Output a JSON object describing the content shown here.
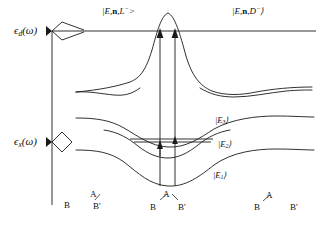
{
  "figure": {
    "type": "energy-level-potential-curve-diagram",
    "width": 321,
    "height": 226,
    "background": "#ffffff",
    "stroke_color": "#1a1a1a",
    "text_color": "#101010"
  },
  "axes": {
    "vertical_axis_x": 52,
    "ticks": [
      {
        "name": "epsilon-d-omega",
        "label_parts": {
          "symbol": "ϵ",
          "subscript": "d",
          "arg": "(ω)"
        },
        "label_text": "ϵd(ω)",
        "y": 31
      },
      {
        "name": "epsilon-x-omega",
        "label_parts": {
          "symbol": "ϵ",
          "subscript": "x",
          "arg": "(ω)"
        },
        "label_text": "ϵx(ω)",
        "y": 142
      }
    ]
  },
  "upper_states": {
    "left_label": {
      "text": "|E,n,L⁻>",
      "parts": {
        "bra": "|",
        "E": "E",
        "n": "n",
        "ion": "L",
        "charge": "−",
        "close": ">"
      },
      "x": 102,
      "y": 11
    },
    "right_label": {
      "text": "|E,n,D⁻⟩",
      "parts": {
        "bra": "|",
        "E": "E",
        "n": "n",
        "ion": "D",
        "charge": "−",
        "close": "⟩"
      },
      "x": 232,
      "y": 11
    },
    "continuum_line_y": 31
  },
  "bound_states": [
    {
      "name": "state-E3",
      "label": "|E₃⟩",
      "base": "E",
      "index": "3",
      "x": 215,
      "y": 121
    },
    {
      "name": "state-E2",
      "label": "|E₂⟩",
      "base": "E",
      "index": "2",
      "x": 218,
      "y": 145
    },
    {
      "name": "state-E1",
      "label": "|E₁⟩",
      "base": "E",
      "index": "1",
      "x": 213,
      "y": 176
    }
  ],
  "transitions": [
    {
      "name": "pump-arrow-left",
      "x": 160,
      "from_y": 186,
      "to_y": 31
    },
    {
      "name": "pump-arrow-right",
      "x": 175,
      "from_y": 186,
      "to_y": 31
    },
    {
      "name": "intermediate-arrow",
      "x": 160,
      "from_y": 155,
      "to_y": 139
    }
  ],
  "vibrational_level_line": {
    "name": "E2-vibrational-level",
    "x1": 130,
    "x2": 213,
    "y": 139
  },
  "reaction_coordinates": [
    {
      "name": "coord-left-B",
      "label": "B",
      "x": 66,
      "y": 206
    },
    {
      "name": "coord-left-A",
      "label": "A",
      "x": 92,
      "y": 196
    },
    {
      "name": "coord-left-Bprime",
      "label": "B'",
      "x": 95,
      "y": 208
    },
    {
      "name": "coord-mid-A",
      "label": "A",
      "x": 165,
      "y": 196
    },
    {
      "name": "coord-mid-B",
      "label": "B",
      "x": 152,
      "y": 209
    },
    {
      "name": "coord-mid-Bprime",
      "label": "B'",
      "x": 180,
      "y": 209
    },
    {
      "name": "coord-right-A",
      "label": "A",
      "x": 268,
      "y": 197
    },
    {
      "name": "coord-right-B",
      "label": "B",
      "x": 256,
      "y": 209
    },
    {
      "name": "coord-right-Bprime",
      "label": "B'",
      "x": 292,
      "y": 209
    }
  ],
  "curves": {
    "continuum_horizontal": "horizontal line at y=31 from x=52 to x=316",
    "peak_curve": "sharp resonance peak centered near x=168 rising above continuum",
    "upper_dip_curve": "broad shallow curve with double dip near y=88",
    "E3_curve": "wide shallow well, minimum near y=148",
    "E2_curve": "narrower well, minimum near y=156",
    "E1_curve": "lowest well, minimum near y=186"
  }
}
